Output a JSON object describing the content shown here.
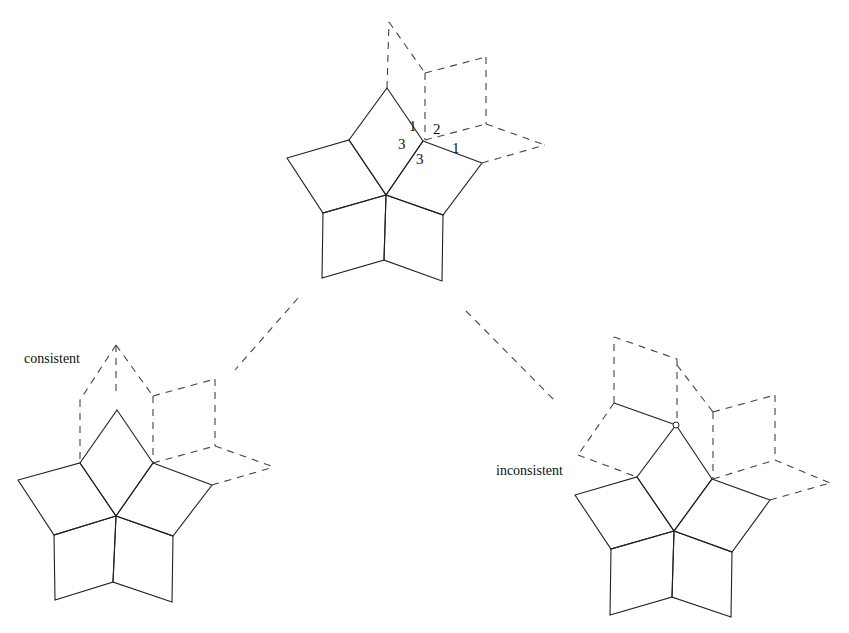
{
  "diagram": {
    "type": "rhombus-tiling-vertex-stars",
    "top_star": {
      "labels": [
        {
          "text": "1",
          "x": 409,
          "y": 131
        },
        {
          "text": "2",
          "x": 433,
          "y": 134
        },
        {
          "text": "3",
          "x": 398,
          "y": 149
        },
        {
          "text": "1",
          "x": 452,
          "y": 153
        },
        {
          "text": "3",
          "x": 416,
          "y": 164
        }
      ]
    },
    "left_star": {
      "caption": "consistent"
    },
    "right_star": {
      "caption": "inconsistent"
    },
    "colors": {
      "line": "#222222",
      "dashed": "#444444",
      "background": "#ffffff"
    }
  }
}
